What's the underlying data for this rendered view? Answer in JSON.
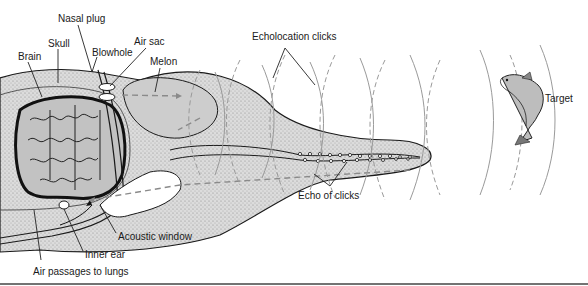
{
  "diagram": {
    "labels": {
      "nasal_plug": "Nasal plug",
      "skull": "Skull",
      "blowhole": "Blowhole",
      "air_sac": "Air sac",
      "brain": "Brain",
      "melon": "Melon",
      "echolocation_clicks": "Echolocation clicks",
      "target": "Target",
      "echo_of_clicks": "Echo of clicks",
      "acoustic_window": "Acoustic window",
      "inner_ear": "Inner ear",
      "air_passages": "Air passages to lungs"
    },
    "colors": {
      "head_stipple": "#d8d8d8",
      "melon_fill": "#c9c9c9",
      "brain_fill": "#b5b5b5",
      "outline": "#1a1a1a",
      "waves": "#9a9a9a"
    }
  }
}
